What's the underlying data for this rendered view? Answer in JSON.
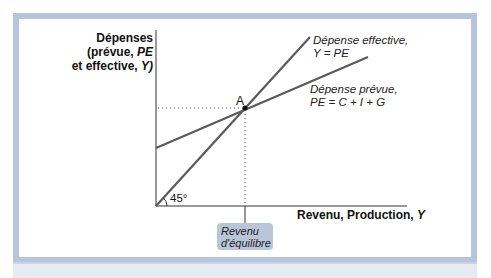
{
  "axes": {
    "y_label_line1": "Dépenses",
    "y_label_line2_prefix": "(prévue, ",
    "y_label_line2_var": "PE",
    "y_label_line3_prefix": "et effective, ",
    "y_label_line3_var": "Y)",
    "x_label_prefix": "Revenu, Production, ",
    "x_label_var": "Y"
  },
  "lines": {
    "actual": {
      "name": "Dépense effective,",
      "equation": "Y = PE"
    },
    "planned": {
      "name": "Dépense prévue,",
      "equation": "PE = C + I + G"
    }
  },
  "point": {
    "label": "A"
  },
  "angle": {
    "label": "45°"
  },
  "equilibrium": {
    "line1": "Revenu",
    "line2": "d'équilibre"
  },
  "colors": {
    "frame": "#b7c5dc",
    "line": "#5a5a5a",
    "box": "#b9c6da"
  }
}
